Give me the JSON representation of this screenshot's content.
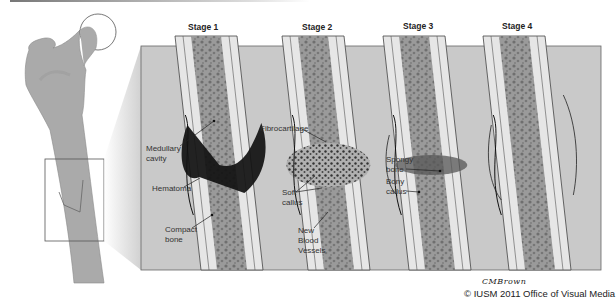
{
  "stages": [
    {
      "label": "Stage 1"
    },
    {
      "label": "Stage 2"
    },
    {
      "label": "Stage 3"
    },
    {
      "label": "Stage 4"
    }
  ],
  "labels": {
    "medullary_cavity": "Medullary\ncavity",
    "hematoma": "Hematoma",
    "compact_bone": "Compact\nbone",
    "fibrocartilage": "Fibrocartilage",
    "soft_callus": "Soft\ncallus",
    "new_blood_vessels": "New\nBlood\nVessels",
    "spongy_bone": "Spongy\nbone",
    "bony_callus": "Bony\ncallus"
  },
  "signature": "CMBrown",
  "credit": "© IUSM 2011 Office of Visual Media",
  "colors": {
    "panel": "#c9c9c9",
    "panel_side": "#b5b5b5",
    "femur": "#a9a9a9",
    "cortex": "#e6e6e6",
    "marrow": "#8f8f8f",
    "hematoma": "#111111"
  }
}
